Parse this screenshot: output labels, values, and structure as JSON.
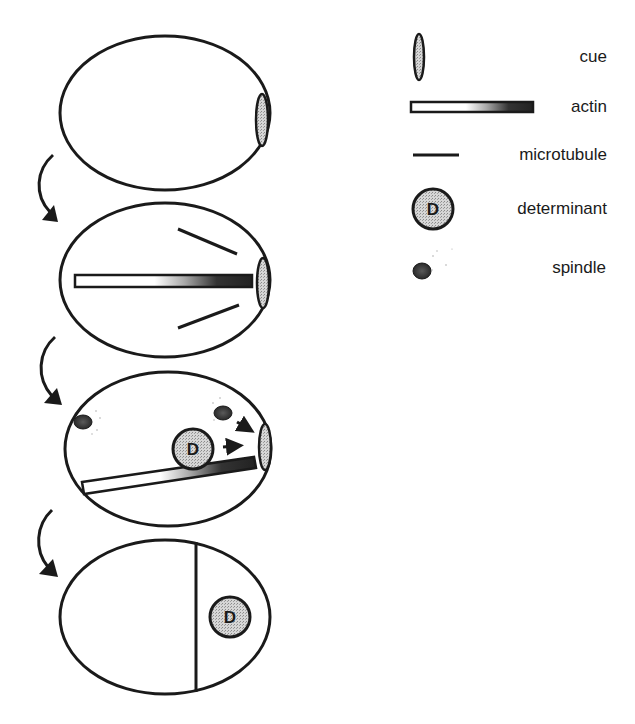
{
  "legend": {
    "items": [
      {
        "icon": "cue",
        "label": "cue"
      },
      {
        "icon": "actin",
        "label": "actin"
      },
      {
        "icon": "microtubule",
        "label": "microtubule"
      },
      {
        "icon": "determinant",
        "label": "determinant",
        "glyph": "D"
      },
      {
        "icon": "spindle",
        "label": "spindle"
      }
    ]
  },
  "stages": [
    {
      "name": "stage-1",
      "elements": [
        "cue"
      ]
    },
    {
      "name": "stage-2",
      "elements": [
        "cue",
        "actin",
        "microtubule",
        "microtubule"
      ]
    },
    {
      "name": "stage-3",
      "elements": [
        "cue",
        "actin",
        "spindle",
        "spindle",
        "determinant",
        "arrow",
        "arrow"
      ],
      "determinant_glyph": "D"
    },
    {
      "name": "stage-4",
      "elements": [
        "division-line",
        "determinant"
      ],
      "determinant_glyph": "D"
    }
  ],
  "colors": {
    "stroke": "#1a1a1a",
    "stipple": "#b8b8b8",
    "actin_dark": "#2a2a2a",
    "background": "#ffffff"
  }
}
